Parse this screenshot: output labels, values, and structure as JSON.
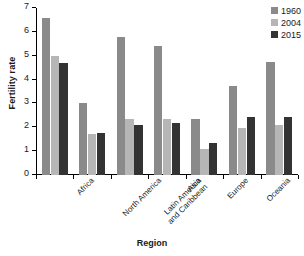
{
  "chart_data": {
    "type": "bar",
    "title": "",
    "subtitle": "",
    "xlabel": "Region",
    "ylabel": "Fertility rate",
    "ylim": [
      0,
      7
    ],
    "yticks": [
      0,
      1,
      2,
      3,
      4,
      5,
      6,
      7
    ],
    "ytick_labels": [
      "0",
      "1",
      "2",
      "3",
      "4",
      "5",
      "6",
      "7"
    ],
    "grid": false,
    "legend_position": "top-right",
    "categories": [
      "Africa",
      "North America",
      "Latin America and Caribbean",
      "Asia",
      "Europe",
      "Oceania",
      "World average"
    ],
    "category_lines": [
      [
        "Africa"
      ],
      [
        "North America"
      ],
      [
        "Latin America",
        "and Caribbean"
      ],
      [
        "Asia"
      ],
      [
        "Europe"
      ],
      [
        "Oceania"
      ],
      [
        "World average"
      ]
    ],
    "series": [
      {
        "name": "1960",
        "color": "#8a8a8a",
        "values": [
          6.6,
          3.0,
          5.78,
          5.4,
          2.35,
          3.75,
          4.75
        ]
      },
      {
        "name": "2004",
        "color": "#b6b6b6",
        "values": [
          4.98,
          1.73,
          2.35,
          2.35,
          1.1,
          1.95,
          2.1
        ]
      },
      {
        "name": "2015",
        "color": "#333333",
        "values": [
          4.7,
          1.78,
          2.1,
          2.17,
          1.35,
          2.45,
          2.45
        ]
      }
    ]
  },
  "legend": {
    "items": [
      {
        "label": "1960",
        "color": "#8a8a8a"
      },
      {
        "label": "2004",
        "color": "#b6b6b6"
      },
      {
        "label": "2015",
        "color": "#333333"
      }
    ]
  },
  "axes": {
    "y_title": "Fertility rate",
    "x_title": "Region"
  },
  "colors": {
    "axis": "#000000",
    "text": "#1a1a1a",
    "background": "#ffffff"
  }
}
